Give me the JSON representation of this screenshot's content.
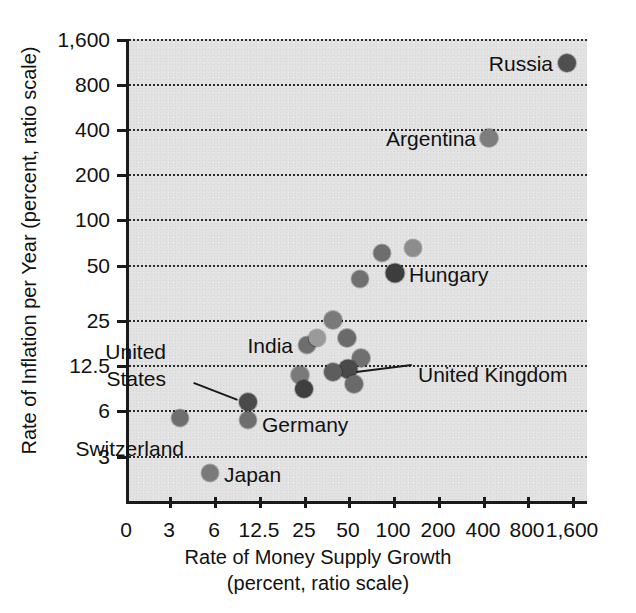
{
  "chart_data": {
    "type": "scatter",
    "title": "",
    "xlabel": "Rate of Money Supply Growth (percent, ratio scale)",
    "ylabel": "Rate of Inflation per Year (percent, ratio scale)",
    "xlabel_line1": "Rate of Money Supply Growth",
    "xlabel_line2": "(percent, ratio scale)",
    "ylabel_text": "Rate of Inflation per Year (percent, ratio scale)",
    "xscale": "log",
    "yscale": "log",
    "grid": "horizontal-dotted",
    "legend": "none",
    "xticks": [
      "0",
      "3",
      "6",
      "12.5",
      "25",
      "50",
      "100",
      "200",
      "400",
      "800",
      "1,600"
    ],
    "xtick_values": [
      0,
      3,
      6,
      12.5,
      25,
      50,
      100,
      200,
      400,
      800,
      1600
    ],
    "yticks": [
      "1,600",
      "800",
      "400",
      "200",
      "100",
      "50",
      "25",
      "12.5",
      "6",
      "3"
    ],
    "ytick_values": [
      1600,
      800,
      400,
      200,
      100,
      50,
      25,
      12.5,
      6,
      3
    ],
    "xlim": [
      2.2,
      2200
    ],
    "ylim": [
      1.9,
      1600
    ],
    "points": [
      {
        "label": "Russia",
        "x": 1400,
        "y": 1150,
        "px": 564,
        "py": 63,
        "r": 9,
        "shade": "#4f4f4f",
        "label_side": "left",
        "label_dx": -14,
        "label_dy": 0
      },
      {
        "label": "Argentina",
        "x": 430,
        "y": 360,
        "px": 486,
        "py": 138,
        "r": 9,
        "shade": "#7d7d7d",
        "label_side": "left",
        "label_dx": -13,
        "label_dy": 0
      },
      {
        "label": "",
        "x": 120,
        "y": 78,
        "px": 410,
        "py": 248,
        "r": 8.5,
        "shade": "#8c8c8c",
        "label_side": "right",
        "label_dx": 0,
        "label_dy": 0
      },
      {
        "label": "",
        "x": 82,
        "y": 70,
        "px": 379,
        "py": 253,
        "r": 8.5,
        "shade": "#6e6e6e",
        "label_side": "right",
        "label_dx": 0,
        "label_dy": 0
      },
      {
        "label": "Hungary",
        "x": 100,
        "y": 50,
        "px": 392,
        "py": 273,
        "r": 9.5,
        "shade": "#3d3d3d",
        "label_side": "right",
        "label_dx": 14,
        "label_dy": 1
      },
      {
        "label": "",
        "x": 57,
        "y": 45,
        "px": 357,
        "py": 279,
        "r": 8.5,
        "shade": "#707070",
        "label_side": "right",
        "label_dx": 0,
        "label_dy": 0
      },
      {
        "label": "",
        "x": 31,
        "y": 25,
        "px": 330,
        "py": 320,
        "r": 9,
        "shade": "#7a7a7a",
        "label_side": "right",
        "label_dx": 0,
        "label_dy": 0
      },
      {
        "label": "",
        "x": 38,
        "y": 19,
        "px": 344,
        "py": 338,
        "r": 9,
        "shade": "#6a6a6a",
        "label_side": "right",
        "label_dx": 0,
        "label_dy": 0
      },
      {
        "label": "India",
        "x": 19,
        "y": 17,
        "px": 304,
        "py": 345,
        "r": 8.5,
        "shade": "#6e6e6e",
        "label_side": "left",
        "label_dx": -14,
        "label_dy": 0
      },
      {
        "label": "",
        "x": 22,
        "y": 19,
        "px": 314,
        "py": 338,
        "r": 8.5,
        "shade": "#9a9a9a",
        "label_side": "right",
        "label_dx": 0,
        "label_dy": 0
      },
      {
        "label": "",
        "x": 45,
        "y": 13.5,
        "px": 358,
        "py": 358,
        "r": 9,
        "shade": "#707070",
        "label_side": "right",
        "label_dx": 0,
        "label_dy": 0
      },
      {
        "label": "United Kingdom",
        "x": 36,
        "y": 12,
        "px": 345,
        "py": 369,
        "r": 9.5,
        "shade": "#4a4a4a",
        "label_side": "right",
        "label_dx": 70,
        "label_dy": 5
      },
      {
        "label": "",
        "x": 29,
        "y": 11.5,
        "px": 330,
        "py": 372,
        "r": 9,
        "shade": "#5d5d5d",
        "label_side": "right",
        "label_dx": 0,
        "label_dy": 0
      },
      {
        "label": "",
        "x": 17,
        "y": 11,
        "px": 297,
        "py": 375,
        "r": 9,
        "shade": "#7a7a7a",
        "label_side": "right",
        "label_dx": 0,
        "label_dy": 0
      },
      {
        "label": "",
        "x": 40,
        "y": 9.5,
        "px": 351,
        "py": 384,
        "r": 9,
        "shade": "#6a6a6a",
        "label_side": "right",
        "label_dx": 0,
        "label_dy": 0
      },
      {
        "label": "",
        "x": 18,
        "y": 8.5,
        "px": 301,
        "py": 389,
        "r": 9,
        "shade": "#3f3f3f",
        "label_side": "right",
        "label_dx": 0,
        "label_dy": 0
      },
      {
        "label": "United States",
        "x": 11,
        "y": 6.8,
        "px": 245,
        "py": 402,
        "r": 9,
        "shade": "#4a4a4a",
        "label_side": "left",
        "label_dx": -82,
        "label_dy": -36
      },
      {
        "label": "Germany",
        "x": 11,
        "y": 5.3,
        "px": 245,
        "py": 420,
        "r": 8.5,
        "shade": "#6e6e6e",
        "label_side": "right",
        "label_dx": 14,
        "label_dy": 4
      },
      {
        "label": "Switzerland",
        "x": 3.4,
        "y": 5.5,
        "px": 177,
        "py": 418,
        "r": 8.5,
        "shade": "#6e6e6e",
        "label_side": "left",
        "label_dx": 4,
        "label_dy": 30
      },
      {
        "label": "Japan",
        "x": 5.6,
        "y": 2.3,
        "px": 207,
        "py": 473,
        "r": 8.5,
        "shade": "#7a7a7a",
        "label_side": "right",
        "label_dx": 14,
        "label_dy": 1
      }
    ],
    "annotations": [
      {
        "text": "Russia",
        "value_x": 1400,
        "value_y": 1150
      },
      {
        "text": "Argentina",
        "value_x": 430,
        "value_y": 360
      },
      {
        "text": "Hungary",
        "value_x": 100,
        "value_y": 50
      },
      {
        "text": "India",
        "value_x": 19,
        "value_y": 17
      },
      {
        "text": "United Kingdom",
        "value_x": 36,
        "value_y": 12
      },
      {
        "text": "United States",
        "value_x": 11,
        "value_y": 6.8
      },
      {
        "text": "Germany",
        "value_x": 11,
        "value_y": 5.3
      },
      {
        "text": "Switzerland",
        "value_x": 3.4,
        "value_y": 5.5
      },
      {
        "text": "Japan",
        "value_x": 5.6,
        "value_y": 2.3
      }
    ]
  },
  "axis": {
    "y_tick_positions": [
      39,
      84,
      129,
      174,
      219,
      265,
      320,
      365,
      410,
      456
    ],
    "x_tick_positions": [
      126,
      169,
      214,
      259,
      304,
      348,
      393,
      438,
      483,
      527,
      572
    ]
  },
  "colors": {
    "plot_background": "#e2e2e2",
    "axis": "#1a1a1a",
    "gridline": "#2b2b2b",
    "text": "#111111"
  },
  "labels": {
    "united_states_line1": "United",
    "united_states_line2": "States"
  }
}
